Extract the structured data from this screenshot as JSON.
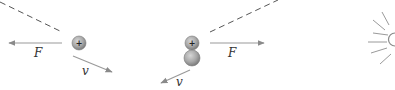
{
  "colors": {
    "arrow": "#9a9a9a",
    "dashed": "#555555",
    "particle_fill": "#a8a8a8",
    "particle_stroke": "#7a7a7a",
    "label": "#333333",
    "rays": "#9a9a9a"
  },
  "panels": [
    {
      "name": "panel-1",
      "particle": {
        "charge_symbol": "+"
      },
      "force_label": "F",
      "velocity_label": "v"
    },
    {
      "name": "panel-2",
      "particle_top": {
        "charge_symbol": "+"
      },
      "force_label": "F",
      "velocity_label": "v"
    },
    {
      "name": "panel-3",
      "description": "radiating emission rays"
    }
  ]
}
